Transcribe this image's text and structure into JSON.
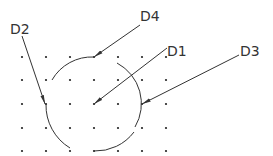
{
  "diagram": {
    "type": "CAD dimension drawing - arcs on dot grid with leader lines",
    "colors": {
      "line": "#333333",
      "dot": "#222222",
      "background": "#ffffff"
    },
    "grid": {
      "xs": [
        22,
        46,
        70,
        94,
        118,
        142,
        166
      ],
      "ys": [
        57,
        80,
        104,
        128,
        151
      ]
    },
    "labels": [
      {
        "id": "D1",
        "text": "D1",
        "x": 167,
        "y": 56
      },
      {
        "id": "D2",
        "text": "D2",
        "x": 10,
        "y": 34
      },
      {
        "id": "D3",
        "text": "D3",
        "x": 240,
        "y": 56
      },
      {
        "id": "D4",
        "text": "D4",
        "x": 140,
        "y": 21
      }
    ]
  }
}
